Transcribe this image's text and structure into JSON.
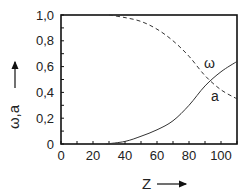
{
  "chart_data": {
    "type": "line",
    "title": "",
    "xlabel": "Z",
    "ylabel": "ω,a",
    "xlim": [
      0,
      110
    ],
    "ylim": [
      0,
      1.0
    ],
    "grid": false,
    "legend": "inline labels",
    "x_ticks": [
      0,
      20,
      40,
      60,
      80,
      100
    ],
    "x_tick_labels": [
      "0",
      "20",
      "40",
      "60",
      "80",
      "100"
    ],
    "y_ticks": [
      0,
      0.2,
      0.4,
      0.6,
      0.8,
      1.0
    ],
    "y_tick_labels": [
      "0",
      "0,2",
      "0,4",
      "0,6",
      "0,8",
      "1,0"
    ],
    "x": [
      0,
      10,
      20,
      30,
      40,
      50,
      60,
      70,
      80,
      90,
      100,
      110
    ],
    "series": [
      {
        "name": "ω",
        "style": "dashed",
        "values": [
          1.0,
          1.0,
          1.0,
          1.0,
          0.98,
          0.95,
          0.89,
          0.8,
          0.68,
          0.53,
          0.42,
          0.35
        ]
      },
      {
        "name": "a",
        "style": "solid",
        "values": [
          0.0,
          0.0,
          0.0,
          0.0,
          0.02,
          0.06,
          0.11,
          0.18,
          0.3,
          0.45,
          0.56,
          0.64
        ]
      }
    ],
    "annotations": [
      {
        "text": "ω",
        "x": 95,
        "y": 0.67
      },
      {
        "text": "a",
        "x": 99,
        "y": 0.37
      }
    ]
  },
  "labels": {
    "x_axis": "Z",
    "y_axis": "ω,a",
    "omega_curve": "ω",
    "a_curve": "a"
  },
  "ticks": {
    "x": [
      "0",
      "20",
      "40",
      "60",
      "80",
      "100"
    ],
    "y": [
      "0",
      "0,2",
      "0,4",
      "0,6",
      "0,8",
      "1,0"
    ]
  },
  "colors": {
    "axis": "#111111",
    "curve": "#333333",
    "text": "#222222"
  }
}
